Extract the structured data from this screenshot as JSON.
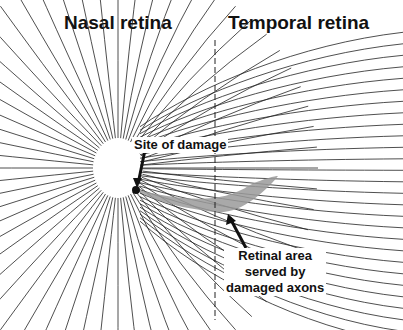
{
  "titles": {
    "left": "Nasal retina",
    "right": "Temporal retina"
  },
  "labels": {
    "damage_site": "Site of damage",
    "area_line1": "Retinal area",
    "area_line2": "served by",
    "area_line3": "damaged axons"
  },
  "colors": {
    "lines": "#222222",
    "shaded_area": "#9a9a9a",
    "optic_disc": "#ffffff"
  }
}
